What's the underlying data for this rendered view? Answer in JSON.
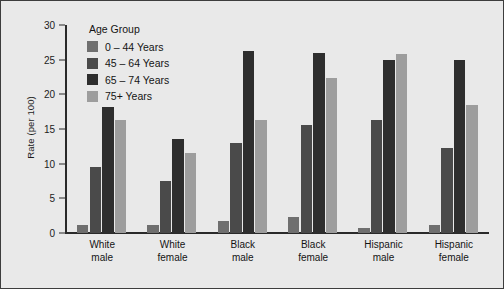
{
  "chart_data": {
    "type": "bar",
    "title": "",
    "xlabel": "",
    "ylabel": "Rate (per 100)",
    "ylim": [
      0,
      30
    ],
    "yticks": [
      "0",
      "5",
      "10",
      "15",
      "20",
      "25",
      "30"
    ],
    "grid": false,
    "legend_position": "top-left-inside",
    "legend_title": "Age Group",
    "categories": [
      [
        "White",
        "male"
      ],
      [
        "White",
        "female"
      ],
      [
        "Black",
        "male"
      ],
      [
        "Black",
        "female"
      ],
      [
        "Hispanic",
        "male"
      ],
      [
        "Hispanic",
        "female"
      ]
    ],
    "series": [
      {
        "name": "0 – 44 Years",
        "color": "#6f6f6f",
        "values": [
          1.2,
          1.2,
          1.7,
          2.3,
          0.7,
          1.2
        ]
      },
      {
        "name": "45 – 64 Years",
        "color": "#4a4a4a",
        "values": [
          9.5,
          7.5,
          13.0,
          15.6,
          16.3,
          12.2
        ]
      },
      {
        "name": "65 – 74 Years",
        "color": "#2e2e2e",
        "values": [
          18.2,
          13.5,
          26.2,
          26.0,
          25.0,
          25.0
        ]
      },
      {
        "name": "75+ Years",
        "color": "#9d9d9d",
        "values": [
          16.3,
          11.6,
          16.3,
          22.3,
          25.8,
          18.5
        ]
      }
    ]
  },
  "figure": {
    "background_color": "#e9e9e9",
    "border_color": "#3d3d3d",
    "axis_color": "#2a2a2a"
  }
}
